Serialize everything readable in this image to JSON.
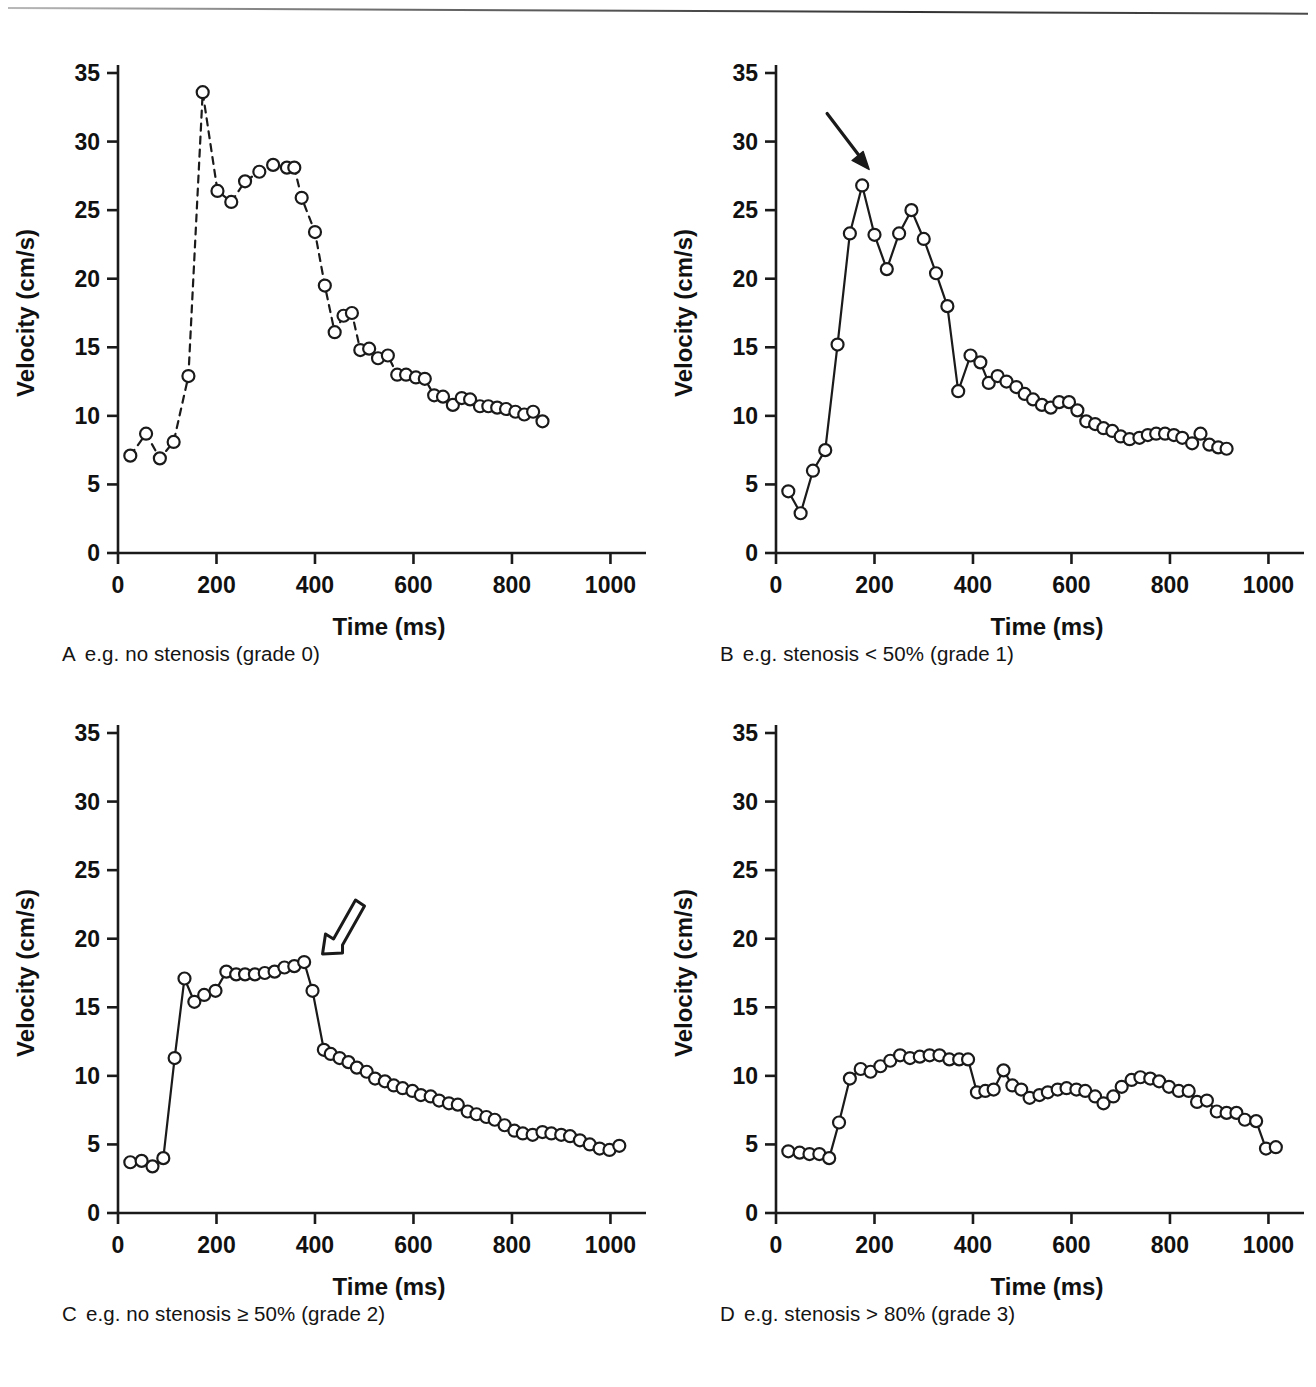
{
  "figure": {
    "background": "#ffffff",
    "ink_color": "#1a1a1a",
    "panel_count": 4
  },
  "axes_common": {
    "xlabel": "Time (ms)",
    "ylabel": "Velocity (cm/s)",
    "xticks": [
      0,
      200,
      400,
      600,
      800,
      1000
    ],
    "yticks": [
      0,
      5,
      10,
      15,
      20,
      25,
      30,
      35
    ],
    "xlim": [
      0,
      1060
    ],
    "ylim": [
      0,
      35
    ],
    "grid": false,
    "legend": "none",
    "marker": "open-circle"
  },
  "panels": [
    {
      "id": "A",
      "letter": "A",
      "caption": "e.g. no stenosis (grade 0)",
      "line_style": "dashed",
      "annotation": null
    },
    {
      "id": "B",
      "letter": "B",
      "caption": "e.g. stenosis < 50% (grade 1)",
      "line_style": "solid",
      "annotation": {
        "type": "arrow-solid",
        "direction": "down-right",
        "points_to_time": 185,
        "points_to_velocity": 26.8
      }
    },
    {
      "id": "C",
      "letter": "C",
      "caption": "e.g. no stenosis ≥ 50% (grade 2)",
      "line_style": "solid",
      "annotation": {
        "type": "arrow-outline",
        "direction": "down-left",
        "points_to_time": 395,
        "points_to_velocity": 18.3
      }
    },
    {
      "id": "D",
      "letter": "D",
      "caption": "e.g. stenosis > 80% (grade 3)",
      "line_style": "solid",
      "annotation": null
    }
  ],
  "chart_data": [
    {
      "type": "line",
      "id": "A",
      "title": "A e.g. no stenosis (grade 0)",
      "xlabel": "Time (ms)",
      "ylabel": "Velocity (cm/s)",
      "xlim": [
        0,
        1060
      ],
      "ylim": [
        0,
        35
      ],
      "xticks": [
        0,
        200,
        400,
        600,
        800,
        1000
      ],
      "yticks": [
        0,
        5,
        10,
        15,
        20,
        25,
        30,
        35
      ],
      "grid": false,
      "linestyle": "dashed",
      "marker": "o",
      "x": [
        25,
        57,
        85,
        113,
        143,
        172,
        202,
        230,
        258,
        287,
        315,
        343,
        358,
        373,
        400,
        420,
        440,
        458,
        475,
        492,
        510,
        528,
        548,
        567,
        585,
        605,
        623,
        642,
        660,
        680,
        698,
        715,
        735,
        752,
        770,
        788,
        807,
        825,
        843,
        862,
        880,
        900
      ],
      "y": [
        7.1,
        8.7,
        6.9,
        8.1,
        12.9,
        33.6,
        26.4,
        25.6,
        27.1,
        27.8,
        28.3,
        28.1,
        28.1,
        25.9,
        23.4,
        19.5,
        16.1,
        17.3,
        17.5,
        14.8,
        14.9,
        14.2,
        14.4,
        13.0,
        13.0,
        12.8,
        12.7,
        11.5,
        11.4,
        10.8,
        11.3,
        11.2,
        10.7,
        10.7,
        10.6,
        10.5,
        10.3,
        10.1,
        10.3,
        9.6
      ],
      "ylabel_unit": "cm/s"
    },
    {
      "type": "line",
      "id": "B",
      "title": "B e.g. stenosis < 50% (grade 1)",
      "xlabel": "Time (ms)",
      "ylabel": "Velocity (cm/s)",
      "xlim": [
        0,
        1060
      ],
      "ylim": [
        0,
        35
      ],
      "xticks": [
        0,
        200,
        400,
        600,
        800,
        1000
      ],
      "yticks": [
        0,
        5,
        10,
        15,
        20,
        25,
        30,
        35
      ],
      "grid": false,
      "linestyle": "solid",
      "marker": "o",
      "annotation": {
        "text": "arrow",
        "x": 185,
        "y": 26.8
      },
      "x": [
        25,
        50,
        75,
        100,
        125,
        150,
        175,
        200,
        225,
        250,
        275,
        300,
        325,
        348,
        370,
        395,
        415,
        432,
        450,
        468,
        488,
        505,
        522,
        540,
        558,
        575,
        595,
        612,
        630,
        648,
        665,
        683,
        700,
        718,
        738,
        755,
        772,
        790,
        808,
        825,
        845,
        862,
        880,
        898,
        915,
        935,
        952,
        970,
        988,
        1005,
        1022
      ],
      "y": [
        4.5,
        2.9,
        6.0,
        7.5,
        15.2,
        23.3,
        26.8,
        23.2,
        20.7,
        23.3,
        25.0,
        22.9,
        20.4,
        18.0,
        11.8,
        14.4,
        13.9,
        12.4,
        12.9,
        12.5,
        12.1,
        11.6,
        11.2,
        10.8,
        10.6,
        11.0,
        11.0,
        10.4,
        9.6,
        9.4,
        9.1,
        8.9,
        8.5,
        8.3,
        8.4,
        8.6,
        8.7,
        8.7,
        8.6,
        8.4,
        8.0,
        8.7,
        7.9,
        7.7,
        7.6
      ],
      "ylabel_unit": "cm/s"
    },
    {
      "type": "line",
      "id": "C",
      "title": "C e.g. no stenosis ≥ 50% (grade 2)",
      "xlabel": "Time (ms)",
      "ylabel": "Velocity (cm/s)",
      "xlim": [
        0,
        1060
      ],
      "ylim": [
        0,
        35
      ],
      "xticks": [
        0,
        200,
        400,
        600,
        800,
        1000
      ],
      "yticks": [
        0,
        5,
        10,
        15,
        20,
        25,
        30,
        35
      ],
      "grid": false,
      "linestyle": "solid",
      "marker": "o",
      "annotation": {
        "text": "arrow-outline",
        "x": 395,
        "y": 18.3
      },
      "x": [
        25,
        48,
        70,
        92,
        115,
        135,
        155,
        175,
        198,
        220,
        240,
        258,
        278,
        298,
        318,
        338,
        358,
        378,
        395,
        418,
        432,
        450,
        468,
        485,
        505,
        522,
        542,
        560,
        578,
        598,
        615,
        635,
        652,
        672,
        690,
        710,
        728,
        748,
        765,
        785,
        805,
        822,
        842,
        862,
        880,
        900,
        918,
        938,
        958,
        978,
        998,
        1018,
        1038
      ],
      "y": [
        3.7,
        3.8,
        3.4,
        4.0,
        11.3,
        17.1,
        15.4,
        15.9,
        16.2,
        17.6,
        17.4,
        17.4,
        17.4,
        17.5,
        17.6,
        17.9,
        18.0,
        18.3,
        16.2,
        11.9,
        11.6,
        11.3,
        11.0,
        10.6,
        10.3,
        9.8,
        9.6,
        9.3,
        9.1,
        8.9,
        8.6,
        8.5,
        8.2,
        8.0,
        7.9,
        7.4,
        7.2,
        7.0,
        6.8,
        6.4,
        6.0,
        5.8,
        5.7,
        5.9,
        5.8,
        5.7,
        5.6,
        5.3,
        5.0,
        4.7,
        4.6,
        4.9
      ],
      "ylabel_unit": "cm/s"
    },
    {
      "type": "line",
      "id": "D",
      "title": "D e.g. stenosis > 80% (grade 3)",
      "xlabel": "Time (ms)",
      "ylabel": "Velocity (cm/s)",
      "xlim": [
        0,
        1060
      ],
      "ylim": [
        0,
        35
      ],
      "xticks": [
        0,
        200,
        400,
        600,
        800,
        1000
      ],
      "yticks": [
        0,
        5,
        10,
        15,
        20,
        25,
        30,
        35
      ],
      "grid": false,
      "linestyle": "solid",
      "marker": "o",
      "x": [
        25,
        48,
        68,
        88,
        108,
        128,
        150,
        172,
        192,
        212,
        232,
        252,
        272,
        292,
        312,
        332,
        352,
        372,
        390,
        408,
        425,
        442,
        462,
        480,
        498,
        515,
        535,
        552,
        572,
        590,
        610,
        628,
        648,
        665,
        685,
        702,
        722,
        740,
        760,
        778,
        798,
        818,
        838,
        855,
        875,
        895,
        915,
        935,
        952,
        975,
        995,
        1015,
        1038
      ],
      "y": [
        4.5,
        4.4,
        4.3,
        4.3,
        4.0,
        6.6,
        9.8,
        10.5,
        10.3,
        10.7,
        11.1,
        11.5,
        11.3,
        11.4,
        11.5,
        11.5,
        11.2,
        11.2,
        11.2,
        8.8,
        8.9,
        9.0,
        10.4,
        9.3,
        9.0,
        8.4,
        8.6,
        8.8,
        9.0,
        9.1,
        9.0,
        8.9,
        8.5,
        8.0,
        8.5,
        9.2,
        9.7,
        9.9,
        9.8,
        9.6,
        9.2,
        8.9,
        8.9,
        8.1,
        8.2,
        7.4,
        7.3,
        7.3,
        6.8,
        6.7,
        4.7,
        4.8
      ],
      "ylabel_unit": "cm/s"
    }
  ]
}
